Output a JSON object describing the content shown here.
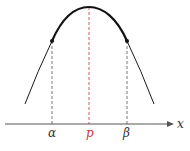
{
  "diagram": {
    "axis_label": "x",
    "labels": {
      "alpha": "α",
      "p": "p",
      "beta": "β"
    },
    "colors": {
      "curve": "#1a1a1a",
      "axis": "#555555",
      "dashed_sides": "#555555",
      "dashed_center": "#cc3333",
      "label_p": "#cc3333",
      "label_other": "#333333"
    },
    "watermark_fragment": ""
  }
}
